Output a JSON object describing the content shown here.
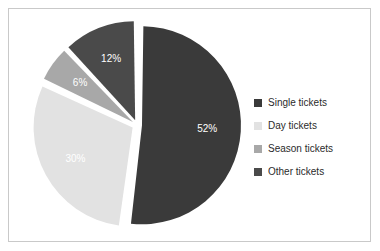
{
  "chart_data": {
    "type": "pie",
    "title": "",
    "subtitle": "",
    "xlabel": "",
    "ylabel": "",
    "grid": false,
    "legend_position": "right",
    "exploded": true,
    "start_angle_deg": 0,
    "direction": "clockwise",
    "categories": [
      "Single tickets",
      "Day tickets",
      "Season tickets",
      "Other tickets"
    ],
    "values": [
      52,
      30,
      6,
      12
    ],
    "value_unit": "%",
    "data_labels": [
      "52%",
      "30%",
      "6%",
      "12%"
    ],
    "slice_colors": [
      "#3a3a3a",
      "#e2e2e2",
      "#a8a8a8",
      "#4a4a4a"
    ],
    "label_text_color": "#ffffff",
    "slices": [
      {
        "label": "Single tickets",
        "value": 52,
        "data_label": "52%",
        "color": "#3a3a3a"
      },
      {
        "label": "Day tickets",
        "value": 30,
        "data_label": "30%",
        "color": "#e2e2e2"
      },
      {
        "label": "Season tickets",
        "value": 6,
        "data_label": "6%",
        "color": "#a8a8a8"
      },
      {
        "label": "Other tickets",
        "value": 12,
        "data_label": "12%",
        "color": "#4a4a4a"
      }
    ]
  },
  "legend": {
    "items": [
      {
        "label": "Single tickets",
        "color": "#3a3a3a"
      },
      {
        "label": "Day tickets",
        "color": "#e2e2e2"
      },
      {
        "label": "Season tickets",
        "color": "#a8a8a8"
      },
      {
        "label": "Other tickets",
        "color": "#4a4a4a"
      }
    ]
  },
  "frame": {
    "background": "#ffffff",
    "border_color": "#c9c9c9"
  }
}
